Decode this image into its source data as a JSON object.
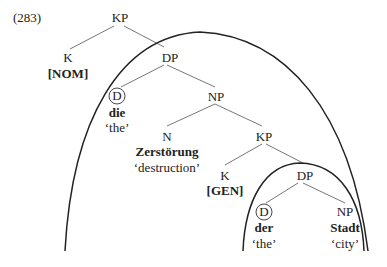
{
  "example_number": "(283)",
  "tree": {
    "root": {
      "label": "KP"
    },
    "k_nom": {
      "label": "K",
      "feature": "[NOM]"
    },
    "dp1": {
      "label": "DP"
    },
    "d1": {
      "label": "D",
      "word": "die",
      "gloss": "‘the’"
    },
    "np1": {
      "label": "NP"
    },
    "n": {
      "label": "N",
      "word": "Zerstörung",
      "gloss": "‘destruction’"
    },
    "kp2": {
      "label": "KP"
    },
    "k_gen": {
      "label": "K",
      "feature": "[GEN]"
    },
    "dp2": {
      "label": "DP"
    },
    "d2": {
      "label": "D",
      "word": "der",
      "gloss": "‘the’"
    },
    "np2": {
      "label": "NP",
      "word": "Stadt",
      "gloss": "‘city’"
    }
  },
  "annotations": {
    "circled_nodes": [
      "d1",
      "d2"
    ],
    "arcs": [
      "outer-phase-arc",
      "inner-phase-arc"
    ]
  }
}
